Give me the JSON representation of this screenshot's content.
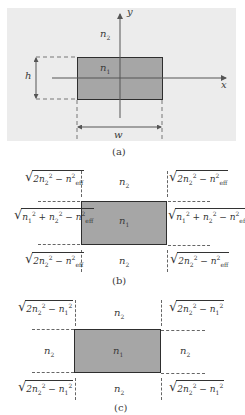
{
  "figure": {
    "panel_a": {
      "caption": "(a)",
      "y_axis_label": "y",
      "x_axis_label": "x",
      "cladding_label": "n2",
      "core_label": "n1",
      "height_label": "h",
      "width_label": "w",
      "colors": {
        "background": "#ececec",
        "core": "#a6a6a6",
        "border": "#2e2e2e"
      }
    },
    "panel_b": {
      "caption": "(b)",
      "top_left": "√(2n₂² − n_eff²)",
      "top_center": "n2",
      "top_right": "√(2n₂² − n_eff²)",
      "mid_left": "√(n₁² + n₂² − n_eff²)",
      "center": "n1",
      "mid_right": "√(n₁² + n₂² − n_eff²)",
      "bottom_left": "√(2n₂² − n_eff²)",
      "bottom_center": "n2",
      "bottom_right": "√(2n₂² − n_eff²)"
    },
    "panel_c": {
      "caption": "(c)",
      "top_left": "√(2n₂² − n₁²)",
      "top_center": "n2",
      "top_right": "√(2n₂² − n₁²)",
      "mid_left": "n2",
      "center": "n1",
      "mid_right": "n2",
      "bottom_left": "√(2n₂² − n₁²)",
      "bottom_center": "n2",
      "bottom_right": "√(2n₂² − n₁²)"
    }
  }
}
